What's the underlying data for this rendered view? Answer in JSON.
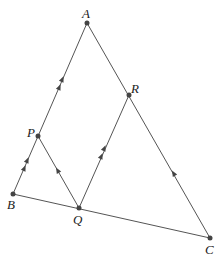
{
  "diagram": {
    "points": {
      "A": {
        "label": "A",
        "x": 87,
        "y": 23
      },
      "R": {
        "label": "R",
        "x": 129,
        "y": 95
      },
      "P": {
        "label": "P",
        "x": 38,
        "y": 136
      },
      "B": {
        "label": "B",
        "x": 13,
        "y": 194
      },
      "Q": {
        "label": "Q",
        "x": 79,
        "y": 208
      },
      "C": {
        "label": "C",
        "x": 210,
        "y": 238
      }
    },
    "segments": [
      "A-B",
      "A-C",
      "B-C",
      "P-Q",
      "Q-R"
    ],
    "parallel_marks": {
      "double_arrow": [
        "B-A",
        "Q-R"
      ],
      "single_arrow": [
        "Q-P",
        "C-A"
      ]
    }
  }
}
